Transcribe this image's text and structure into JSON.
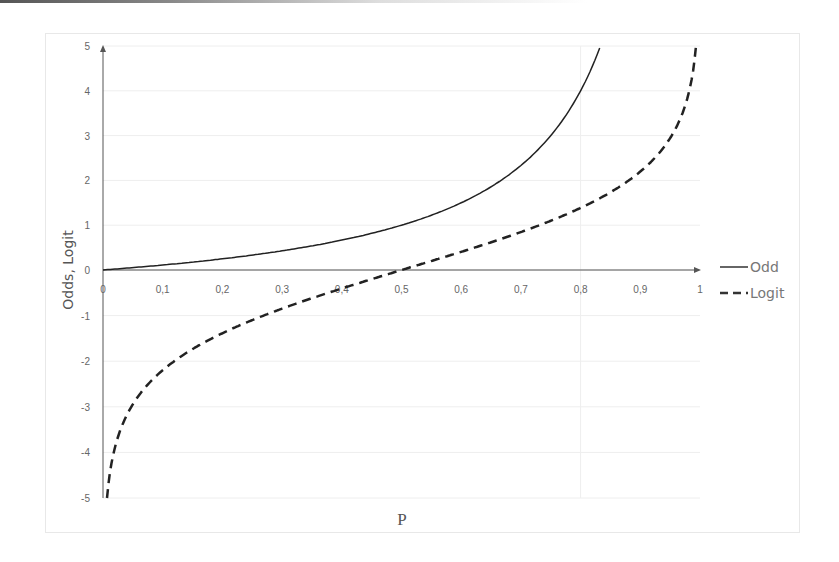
{
  "chart_data": {
    "type": "line",
    "title": "",
    "xlabel": "P",
    "ylabel": "Odds, Logit",
    "xlim": [
      0,
      1
    ],
    "ylim": [
      -5,
      5
    ],
    "x_ticks": [
      "0",
      "0,1",
      "0,2",
      "0,3",
      "0,4",
      "0,5",
      "0,6",
      "0,7",
      "0,8",
      "0,9",
      "1"
    ],
    "y_ticks": [
      "5",
      "4",
      "3",
      "2",
      "1",
      "0",
      "-1",
      "-2",
      "-3",
      "-4",
      "-5"
    ],
    "grid": true,
    "legend_position": "right",
    "series": [
      {
        "name": "Odd",
        "style": "solid",
        "formula": "p/(1-p)",
        "x": [
          0,
          0.1,
          0.2,
          0.3,
          0.4,
          0.5,
          0.6,
          0.7,
          0.75,
          0.8,
          0.833
        ],
        "values": [
          0,
          0.11,
          0.25,
          0.43,
          0.67,
          1.0,
          1.5,
          2.33,
          3.0,
          4.0,
          5.0
        ]
      },
      {
        "name": "Logit",
        "style": "dashed",
        "formula": "ln(p/(1-p))",
        "x": [
          0.007,
          0.02,
          0.05,
          0.1,
          0.2,
          0.3,
          0.4,
          0.5,
          0.6,
          0.7,
          0.8,
          0.9,
          0.95,
          0.98,
          0.993
        ],
        "values": [
          -5.0,
          -3.89,
          -2.94,
          -2.2,
          -1.39,
          -0.85,
          -0.41,
          0,
          0.41,
          0.85,
          1.39,
          2.2,
          2.94,
          3.89,
          5.0
        ]
      }
    ]
  },
  "legend": {
    "items": [
      {
        "label": "Odd",
        "style": "solid"
      },
      {
        "label": "Logit",
        "style": "dashed"
      }
    ]
  },
  "colors": {
    "line": "#222222",
    "axis": "#555555",
    "grid": "#eeeeee",
    "text": "#666666"
  }
}
